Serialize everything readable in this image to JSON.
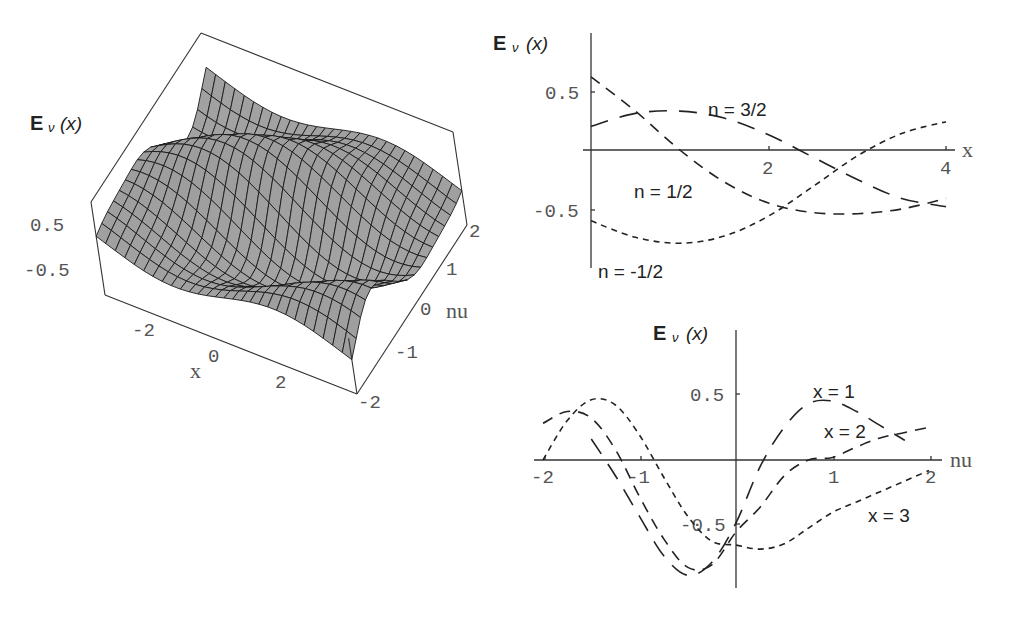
{
  "chart_data": [
    {
      "id": "surface",
      "type": "surface3d",
      "title": "",
      "zlabel": "E_ν(x)",
      "xlabel": "x",
      "ylabel": "nu",
      "x_ticks": [
        "-2",
        "0",
        "2"
      ],
      "y_ticks": [
        "-2",
        "-1",
        "0",
        "1",
        "2"
      ],
      "z_ticks": [
        "0.5",
        "-0.5"
      ],
      "x_range": [
        -3.5,
        3.5
      ],
      "y_range": [
        -2,
        2
      ],
      "z_range": [
        -1,
        1
      ],
      "grid": "mesh",
      "surface_color": "#9a9a9a"
    },
    {
      "id": "vs-x",
      "type": "line",
      "ylabel": "E_ν(x)",
      "xlabel": "x",
      "x_ticks": [
        "2",
        "4"
      ],
      "y_ticks": [
        "0.5",
        "-0.5"
      ],
      "xlim": [
        0,
        4
      ],
      "ylim": [
        -0.85,
        0.85
      ],
      "grid": false,
      "x": [
        0,
        0.5,
        1,
        1.5,
        2,
        2.5,
        3,
        3.5,
        4
      ],
      "series": [
        {
          "name": "n = 1/2",
          "dash": "medium",
          "values": [
            0.62,
            0.33,
            0.0,
            -0.27,
            -0.45,
            -0.53,
            -0.54,
            -0.5,
            -0.41
          ]
        },
        {
          "name": "n = 3/2",
          "dash": "long",
          "values": [
            0.2,
            0.31,
            0.33,
            0.27,
            0.13,
            -0.06,
            -0.25,
            -0.41,
            -0.48
          ]
        },
        {
          "name": "n = -1/2",
          "dash": "short",
          "values": [
            -0.6,
            -0.74,
            -0.79,
            -0.73,
            -0.56,
            -0.31,
            -0.05,
            0.14,
            0.24
          ]
        }
      ]
    },
    {
      "id": "vs-nu",
      "type": "line",
      "ylabel": "E_ν(x)",
      "xlabel": "nu",
      "x_ticks": [
        "-2",
        "-1",
        "1",
        "2"
      ],
      "y_ticks": [
        "0.5",
        "-0.5"
      ],
      "xlim": [
        -2,
        2
      ],
      "ylim": [
        -0.95,
        0.95
      ],
      "grid": false,
      "x": [
        -2,
        -1.75,
        -1.5,
        -1.25,
        -1,
        -0.75,
        -0.5,
        -0.25,
        0,
        0.25,
        0.5,
        0.75,
        1,
        1.25,
        1.5,
        1.75,
        2
      ],
      "series": [
        {
          "name": "x = 1",
          "dash": "long",
          "values": [
            null,
            null,
            0.16,
            -0.12,
            -0.43,
            -0.73,
            -0.88,
            -0.78,
            -0.48,
            -0.05,
            0.25,
            0.43,
            0.45,
            0.37,
            0.26,
            0.15,
            null
          ]
        },
        {
          "name": "x = 2",
          "dash": "medium",
          "values": [
            0.28,
            0.37,
            0.32,
            0.08,
            -0.28,
            -0.6,
            -0.82,
            -0.8,
            -0.55,
            -0.36,
            -0.12,
            0.0,
            0.02,
            0.1,
            0.17,
            0.21,
            0.25
          ]
        },
        {
          "name": "x = 3",
          "dash": "short",
          "values": [
            0.0,
            0.3,
            0.46,
            0.42,
            0.19,
            -0.13,
            -0.43,
            -0.62,
            -0.65,
            -0.68,
            -0.64,
            -0.52,
            -0.4,
            -0.32,
            -0.24,
            -0.16,
            -0.08
          ]
        }
      ]
    }
  ],
  "labels": {
    "E": "E",
    "nu_sub": "ν",
    "paren_x": "(x)"
  }
}
